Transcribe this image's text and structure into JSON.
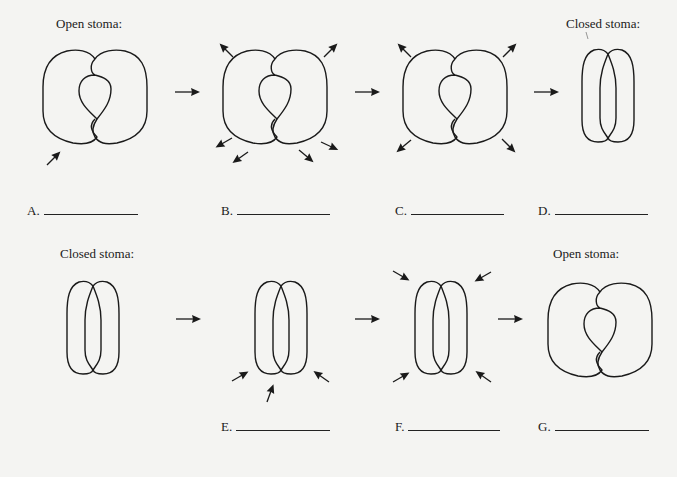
{
  "worksheet": {
    "rows": [
      {
        "id": "opening-to-closing",
        "start_caption": "Open stoma:",
        "end_caption": "Closed stoma:",
        "stages": [
          {
            "label": "A.",
            "state": "open",
            "arrows": "single arrow pointing inward at lower-left"
          },
          {
            "label": "B.",
            "state": "open",
            "arrows": "arrows pointing outward"
          },
          {
            "label": "C.",
            "state": "open",
            "arrows": "arrows pointing outward"
          },
          {
            "label": "D.",
            "state": "closed",
            "arrows": "none"
          }
        ]
      },
      {
        "id": "closing-to-opening",
        "start_caption": "Closed stoma:",
        "end_caption": "Open stoma:",
        "stages": [
          {
            "label": "",
            "state": "closed",
            "arrows": "none"
          },
          {
            "label": "E.",
            "state": "closed",
            "arrows": "arrows pointing inward from below"
          },
          {
            "label": "F.",
            "state": "closed",
            "arrows": "arrows pointing inward from corners"
          },
          {
            "label": "G.",
            "state": "open",
            "arrows": "none"
          }
        ]
      }
    ],
    "labels": {
      "a": "A.",
      "b": "B.",
      "c": "C.",
      "d": "D.",
      "e": "E.",
      "f": "F.",
      "g": "G."
    },
    "captions": {
      "top_left": "Open stoma:",
      "top_right": "Closed stoma:",
      "bottom_left": "Closed stoma:",
      "bottom_right": "Open stoma:"
    },
    "colors": {
      "ink": "#1a1a1a",
      "paper": "#f4f4f2"
    }
  }
}
